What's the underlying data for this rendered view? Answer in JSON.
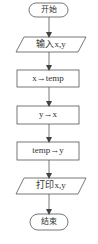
{
  "diagram": {
    "type": "flowchart",
    "stroke_color": "#555555",
    "text_color": "#333333",
    "nodes": [
      {
        "id": "start",
        "shape": "terminal",
        "label": "开始"
      },
      {
        "id": "input",
        "shape": "parallelogram",
        "label": "输入x,y"
      },
      {
        "id": "step1",
        "shape": "process",
        "label": "x→temp"
      },
      {
        "id": "step2",
        "shape": "process",
        "label": "y→x"
      },
      {
        "id": "step3",
        "shape": "process",
        "label": "temp→y"
      },
      {
        "id": "output",
        "shape": "parallelogram",
        "label": "打印x,y"
      },
      {
        "id": "end",
        "shape": "terminal",
        "label": "结束"
      }
    ],
    "edges": [
      {
        "from": "start",
        "to": "input"
      },
      {
        "from": "input",
        "to": "step1"
      },
      {
        "from": "step1",
        "to": "step2"
      },
      {
        "from": "step2",
        "to": "step3"
      },
      {
        "from": "step3",
        "to": "output"
      },
      {
        "from": "output",
        "to": "end"
      }
    ]
  }
}
